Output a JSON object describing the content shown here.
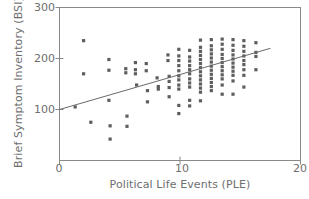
{
  "chart_data": {
    "type": "scatter",
    "title": "",
    "xlabel": "Political Life Events (PLE)",
    "ylabel": "Brief Symptom Inventory (BSI)",
    "xlim": [
      0,
      20
    ],
    "ylim": [
      0,
      300
    ],
    "xticks": [
      0,
      10,
      20
    ],
    "yticks": [
      100,
      200,
      300
    ],
    "xtick_labels": [
      "0",
      "10",
      "20"
    ],
    "ytick_labels": [
      "100",
      "200",
      "300"
    ],
    "grid": false,
    "legend": null,
    "marker": "square",
    "marker_color": "#5e5e5e",
    "axis_color": "#8a8a8a",
    "text_color": "#6e6e6e",
    "trendline": {
      "type": "line",
      "color": "#6a6a6a",
      "x": [
        0,
        17.5
      ],
      "y": [
        100,
        220
      ],
      "intercept": 100,
      "slope": 6.857
    },
    "points": [
      [
        2.0,
        235
      ],
      [
        2.0,
        170
      ],
      [
        1.3,
        105
      ],
      [
        2.6,
        75
      ],
      [
        4.1,
        198
      ],
      [
        4.1,
        177
      ],
      [
        4.1,
        118
      ],
      [
        4.2,
        68
      ],
      [
        4.2,
        42
      ],
      [
        5.5,
        180
      ],
      [
        5.5,
        172
      ],
      [
        5.6,
        87
      ],
      [
        5.6,
        67
      ],
      [
        6.3,
        192
      ],
      [
        6.3,
        178
      ],
      [
        6.3,
        170
      ],
      [
        6.4,
        148
      ],
      [
        7.2,
        190
      ],
      [
        7.2,
        176
      ],
      [
        7.3,
        137
      ],
      [
        7.3,
        115
      ],
      [
        8.1,
        162
      ],
      [
        8.2,
        145
      ],
      [
        8.2,
        140
      ],
      [
        9.0,
        207
      ],
      [
        9.0,
        196
      ],
      [
        9.1,
        165
      ],
      [
        9.1,
        155
      ],
      [
        9.1,
        143
      ],
      [
        9.1,
        125
      ],
      [
        9.9,
        218
      ],
      [
        9.9,
        205
      ],
      [
        9.9,
        196
      ],
      [
        9.9,
        186
      ],
      [
        9.9,
        176
      ],
      [
        9.9,
        166
      ],
      [
        9.9,
        158
      ],
      [
        9.9,
        148
      ],
      [
        9.9,
        140
      ],
      [
        9.9,
        108
      ],
      [
        9.9,
        92
      ],
      [
        10.8,
        216
      ],
      [
        10.8,
        203
      ],
      [
        10.8,
        195
      ],
      [
        10.8,
        186
      ],
      [
        10.8,
        178
      ],
      [
        10.8,
        170
      ],
      [
        10.8,
        160
      ],
      [
        10.8,
        152
      ],
      [
        10.8,
        144
      ],
      [
        10.8,
        118
      ],
      [
        10.8,
        107
      ],
      [
        11.7,
        236
      ],
      [
        11.7,
        222
      ],
      [
        11.7,
        214
      ],
      [
        11.7,
        206
      ],
      [
        11.7,
        198
      ],
      [
        11.7,
        190
      ],
      [
        11.7,
        182
      ],
      [
        11.7,
        174
      ],
      [
        11.7,
        166
      ],
      [
        11.7,
        158
      ],
      [
        11.7,
        150
      ],
      [
        11.7,
        142
      ],
      [
        11.7,
        134
      ],
      [
        11.7,
        117
      ],
      [
        12.6,
        237
      ],
      [
        12.6,
        225
      ],
      [
        12.6,
        217
      ],
      [
        12.6,
        209
      ],
      [
        12.6,
        201
      ],
      [
        12.6,
        193
      ],
      [
        12.6,
        185
      ],
      [
        12.6,
        177
      ],
      [
        12.6,
        169
      ],
      [
        12.6,
        161
      ],
      [
        12.6,
        153
      ],
      [
        12.6,
        145
      ],
      [
        12.6,
        137
      ],
      [
        13.5,
        238
      ],
      [
        13.5,
        228
      ],
      [
        13.5,
        218
      ],
      [
        13.5,
        208
      ],
      [
        13.5,
        200
      ],
      [
        13.5,
        192
      ],
      [
        13.5,
        184
      ],
      [
        13.5,
        176
      ],
      [
        13.5,
        168
      ],
      [
        13.5,
        160
      ],
      [
        13.5,
        148
      ],
      [
        13.5,
        130
      ],
      [
        14.4,
        237
      ],
      [
        14.4,
        226
      ],
      [
        14.4,
        216
      ],
      [
        14.4,
        207
      ],
      [
        14.4,
        199
      ],
      [
        14.4,
        191
      ],
      [
        14.4,
        183
      ],
      [
        14.4,
        175
      ],
      [
        14.4,
        167
      ],
      [
        14.4,
        156
      ],
      [
        14.4,
        130
      ],
      [
        15.3,
        235
      ],
      [
        15.3,
        224
      ],
      [
        15.3,
        214
      ],
      [
        15.3,
        205
      ],
      [
        15.3,
        196
      ],
      [
        15.3,
        188
      ],
      [
        15.3,
        178
      ],
      [
        15.3,
        167
      ],
      [
        15.3,
        144
      ],
      [
        16.3,
        231
      ],
      [
        16.3,
        212
      ],
      [
        16.3,
        204
      ],
      [
        16.3,
        178
      ]
    ]
  },
  "axes": {
    "ytick_labels": [
      "300",
      "200",
      "100"
    ],
    "xtick_labels": [
      "0",
      "10",
      "20"
    ]
  }
}
